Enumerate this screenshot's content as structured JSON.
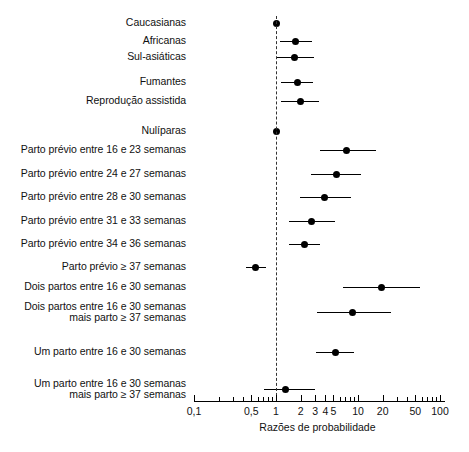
{
  "chart_data": {
    "type": "forest",
    "title": "",
    "xlabel": "Razões de probabilidade",
    "ylabel": "",
    "xscale": "log",
    "xlim": [
      0.1,
      130
    ],
    "reference_line": 1,
    "grid": false,
    "legend": null,
    "xticks_labeled": [
      {
        "value": 0.1,
        "label": "0,1"
      },
      {
        "value": 0.5,
        "label": "0,5"
      },
      {
        "value": 1,
        "label": "1"
      },
      {
        "value": 2,
        "label": "2"
      },
      {
        "value": 3,
        "label": "3"
      },
      {
        "value": 4,
        "label": "4"
      },
      {
        "value": 5,
        "label": "5"
      },
      {
        "value": 10,
        "label": "10"
      },
      {
        "value": 20,
        "label": "20"
      },
      {
        "value": 50,
        "label": "50"
      },
      {
        "value": 100,
        "label": "100"
      }
    ],
    "xticks_minor": [
      0.2,
      0.3,
      0.4,
      0.6,
      0.7,
      0.8,
      0.9,
      6,
      7,
      8,
      9,
      30,
      40,
      60,
      70,
      80,
      90
    ],
    "rows": [
      {
        "label": "Caucasianas",
        "estimate": 1.0,
        "low": 1.0,
        "high": 1.0,
        "reference": true,
        "group": 1
      },
      {
        "label": "Africanas",
        "estimate": 1.75,
        "low": 1.12,
        "high": 2.75,
        "reference": false,
        "group": 1
      },
      {
        "label": "Sul-asiáticas",
        "estimate": 1.7,
        "low": 1.02,
        "high": 2.9,
        "reference": false,
        "group": 1
      },
      {
        "label": "Fumantes",
        "estimate": 1.85,
        "low": 1.15,
        "high": 2.85,
        "reference": false,
        "group": 2
      },
      {
        "label": "Reprodução assistida",
        "estimate": 2.0,
        "low": 1.15,
        "high": 3.3,
        "reference": false,
        "group": 2
      },
      {
        "label": "Nulíparas",
        "estimate": 1.0,
        "low": 1.0,
        "high": 1.0,
        "reference": true,
        "group": 3
      },
      {
        "label": "Parto prévio entre 16 e 23 semanas",
        "estimate": 7.3,
        "low": 3.4,
        "high": 16.5,
        "reference": false,
        "group": 3
      },
      {
        "label": "Parto prévio entre 24 e 27 semanas",
        "estimate": 5.4,
        "low": 2.7,
        "high": 11.0,
        "reference": false,
        "group": 3
      },
      {
        "label": "Parto prévio entre 28 e 30 semanas",
        "estimate": 3.9,
        "low": 1.95,
        "high": 8.2,
        "reference": false,
        "group": 3
      },
      {
        "label": "Parto prévio entre 31 e 33 semanas",
        "estimate": 2.7,
        "low": 1.45,
        "high": 5.2,
        "reference": false,
        "group": 3
      },
      {
        "label": "Parto prévio entre 34 e 36 semanas",
        "estimate": 2.2,
        "low": 1.45,
        "high": 3.4,
        "reference": false,
        "group": 3
      },
      {
        "label": "Parto prévio ≥ 37 semanas",
        "estimate": 0.57,
        "low": 0.43,
        "high": 0.76,
        "reference": false,
        "group": 3
      },
      {
        "label": "Dois partos entre 16 e 30 semanas",
        "estimate": 19.5,
        "low": 6.6,
        "high": 57.0,
        "reference": false,
        "group": 4
      },
      {
        "label": "Dois partos entre 16 e 30 semanas\nmais parto ≥ 37 semanas",
        "estimate": 8.6,
        "low": 3.2,
        "high": 25.0,
        "reference": false,
        "group": 4
      },
      {
        "label": "Um parto entre 16 e 30 semanas",
        "estimate": 5.3,
        "low": 3.1,
        "high": 9.0,
        "reference": false,
        "group": 5
      },
      {
        "label": "Um parto entre 16 e 30 semanas\nmais parto ≥ 37 semanas",
        "estimate": 1.3,
        "low": 0.72,
        "high": 3.0,
        "reference": false,
        "group": 5
      }
    ]
  }
}
